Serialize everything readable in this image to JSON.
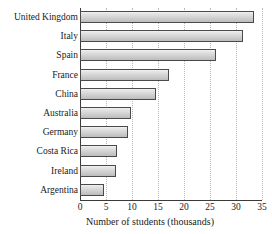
{
  "chart_data": {
    "type": "bar",
    "orientation": "horizontal",
    "title": "",
    "xlabel": "Number of students (thousands)",
    "ylabel": "",
    "xlim": [
      0,
      35
    ],
    "xticks": [
      0,
      5,
      10,
      15,
      20,
      25,
      30,
      35
    ],
    "xtick_labels": [
      "0",
      "5",
      "10",
      "15",
      "20",
      "25",
      "30",
      "35"
    ],
    "grid": "vertical-dotted",
    "legend": "none",
    "categories": [
      "United Kingdom",
      "Italy",
      "Spain",
      "France",
      "China",
      "Australia",
      "Germany",
      "Costa Rica",
      "Ireland",
      "Argentina"
    ],
    "values": [
      33.5,
      31.3,
      26.2,
      17.2,
      14.6,
      9.8,
      9.2,
      7.2,
      7.0,
      4.6
    ],
    "bar_fill": "#d8d8d8",
    "bar_border": "#4a4a4a",
    "gridline_color": "#b9b9b9",
    "axis_color": "#3a3a3a"
  }
}
